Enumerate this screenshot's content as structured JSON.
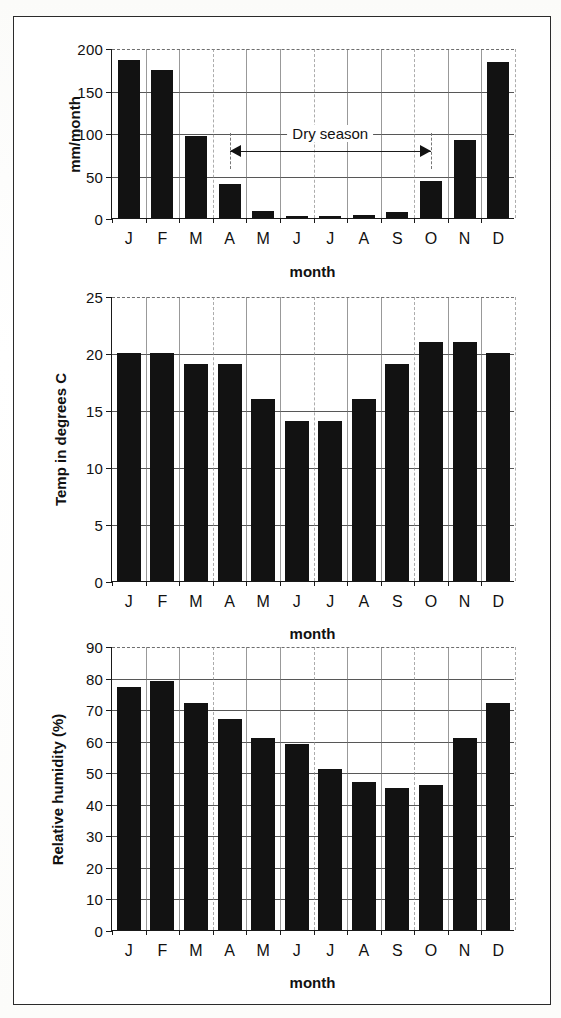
{
  "figure": {
    "border_color": "#2b2b2b",
    "bar_color": "#121212"
  },
  "charts": [
    {
      "id": "rainfall",
      "ylabel": "mm/month",
      "xlabel": "month",
      "yticks": [
        "0",
        "50",
        "100",
        "150",
        "200"
      ],
      "xticks": [
        "J",
        "F",
        "M",
        "A",
        "M",
        "J",
        "J",
        "A",
        "S",
        "O",
        "N",
        "D"
      ],
      "annotation": {
        "label": "Dry season",
        "from": "A",
        "to": "O"
      }
    },
    {
      "id": "temperature",
      "ylabel": "Temp in degrees C",
      "xlabel": "month",
      "yticks": [
        "0",
        "5",
        "10",
        "15",
        "20",
        "25"
      ],
      "xticks": [
        "J",
        "F",
        "M",
        "A",
        "M",
        "J",
        "J",
        "A",
        "S",
        "O",
        "N",
        "D"
      ]
    },
    {
      "id": "humidity",
      "ylabel": "Relative humidity (%)",
      "xlabel": "month",
      "yticks": [
        "0",
        "10",
        "20",
        "30",
        "40",
        "50",
        "60",
        "70",
        "80",
        "90"
      ],
      "xticks": [
        "J",
        "F",
        "M",
        "A",
        "M",
        "J",
        "J",
        "A",
        "S",
        "O",
        "N",
        "D"
      ]
    }
  ],
  "chart_data": [
    {
      "type": "bar",
      "title": "",
      "xlabel": "month",
      "ylabel": "mm/month",
      "ylim": [
        0,
        200
      ],
      "ytick_values": [
        0,
        50,
        100,
        150,
        200
      ],
      "grid": true,
      "legend": "none",
      "categories": [
        "J",
        "F",
        "M",
        "A",
        "M",
        "J",
        "J",
        "A",
        "S",
        "O",
        "N",
        "D"
      ],
      "values": [
        186,
        174,
        97,
        40,
        8,
        2,
        2,
        4,
        7,
        44,
        92,
        184
      ],
      "annotations": [
        {
          "text": "Dry season",
          "type": "double-arrow",
          "x_start": "A",
          "x_end": "O",
          "y": 80
        }
      ]
    },
    {
      "type": "bar",
      "title": "",
      "xlabel": "month",
      "ylabel": "Temp in degrees C",
      "ylim": [
        0,
        25
      ],
      "ytick_values": [
        0,
        5,
        10,
        15,
        20,
        25
      ],
      "grid": true,
      "legend": "none",
      "categories": [
        "J",
        "F",
        "M",
        "A",
        "M",
        "J",
        "J",
        "A",
        "S",
        "O",
        "N",
        "D"
      ],
      "values": [
        20,
        20,
        19,
        19,
        16,
        14,
        14,
        16,
        19,
        21,
        21,
        20
      ]
    },
    {
      "type": "bar",
      "title": "",
      "xlabel": "month",
      "ylabel": "Relative humidity (%)",
      "ylim": [
        0,
        90
      ],
      "ytick_values": [
        0,
        10,
        20,
        30,
        40,
        50,
        60,
        70,
        80,
        90
      ],
      "grid": true,
      "legend": "none",
      "categories": [
        "J",
        "F",
        "M",
        "A",
        "M",
        "J",
        "J",
        "A",
        "S",
        "O",
        "N",
        "D"
      ],
      "values": [
        77,
        79,
        72,
        67,
        61,
        59,
        51,
        47,
        45,
        46,
        61,
        72
      ]
    }
  ]
}
